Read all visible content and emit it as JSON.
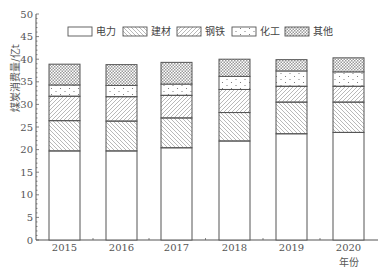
{
  "chart_data": {
    "type": "bar",
    "stacked": true,
    "title": "",
    "xlabel": "年份",
    "ylabel": "煤炭消费量/亿t",
    "ylim": [
      0,
      50
    ],
    "yticks": [
      0,
      5,
      10,
      15,
      20,
      25,
      30,
      35,
      40,
      45,
      50
    ],
    "grid": false,
    "legend_position": "top",
    "categories": [
      "2015",
      "2016",
      "2017",
      "2018",
      "2019",
      "2020"
    ],
    "series": [
      {
        "name": "电力",
        "pattern": "none",
        "values": [
          19.7,
          19.7,
          20.4,
          21.9,
          23.5,
          23.8
        ]
      },
      {
        "name": "建材",
        "pattern": "diag-down",
        "values": [
          6.7,
          6.6,
          6.6,
          6.3,
          7.0,
          6.7
        ]
      },
      {
        "name": "钢铁",
        "pattern": "diag-up",
        "values": [
          5.4,
          5.4,
          5.0,
          5.1,
          3.5,
          3.5
        ]
      },
      {
        "name": "化工",
        "pattern": "dots",
        "values": [
          2.5,
          2.5,
          2.5,
          2.9,
          3.4,
          3.2
        ]
      },
      {
        "name": "其他",
        "pattern": "crosshatch",
        "values": [
          4.6,
          4.6,
          4.8,
          3.8,
          2.5,
          3.1
        ]
      }
    ],
    "totals": [
      38.9,
      38.8,
      39.3,
      40.0,
      39.9,
      40.3
    ]
  },
  "legend": {
    "items": [
      {
        "label": "电力",
        "pattern": "none"
      },
      {
        "label": "建材",
        "pattern": "diag-down"
      },
      {
        "label": "钢铁",
        "pattern": "diag-up"
      },
      {
        "label": "化工",
        "pattern": "dots"
      },
      {
        "label": "其他",
        "pattern": "crosshatch"
      }
    ]
  },
  "axes": {
    "x_title": "年份",
    "y_title": "煤炭消费量/亿t",
    "y_tick_labels": [
      "0",
      "5",
      "10",
      "15",
      "20",
      "25",
      "30",
      "35",
      "40",
      "45",
      "50"
    ],
    "x_tick_labels": [
      "2015",
      "2016",
      "2017",
      "2018",
      "2019",
      "2020"
    ]
  },
  "colors": {
    "stroke": "#555555",
    "hatch": "#8a8a8a",
    "background": "#ffffff"
  }
}
